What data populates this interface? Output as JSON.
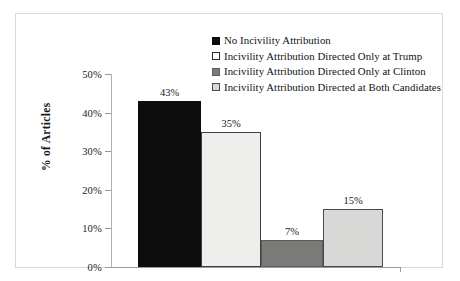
{
  "chart_data": {
    "type": "bar",
    "title": "",
    "xlabel": "",
    "ylabel": "% of Articles",
    "ylim": [
      0,
      50
    ],
    "ytick_labels": [
      "0%",
      "10%",
      "20%",
      "30%",
      "40%",
      "50%"
    ],
    "ytick_values": [
      0,
      10,
      20,
      30,
      40,
      50
    ],
    "grid": false,
    "legend_position": "top-right",
    "categories": [
      "No Incivility Attribution",
      "Incivility Attribution Directed Only at Trump",
      "Incivility Attribution Directed Only at Clinton",
      "Incivility Attribution Directed at Both Candidates"
    ],
    "values": [
      43,
      35,
      7,
      15
    ],
    "data_labels": [
      "43%",
      "35%",
      "7%",
      "15%"
    ],
    "colors": [
      "#0d0c0c",
      "#eeeeec",
      "#7a7a78",
      "#d8d8d6"
    ],
    "bar_border_color": "#4a4a4a"
  },
  "axis": {
    "y_title": "% of Articles",
    "ticks": [
      {
        "label": "50%",
        "value": 50
      },
      {
        "label": "40%",
        "value": 40
      },
      {
        "label": "30%",
        "value": 30
      },
      {
        "label": "20%",
        "value": 20
      },
      {
        "label": "10%",
        "value": 10
      },
      {
        "label": "0%",
        "value": 0
      }
    ]
  },
  "bars": [
    {
      "label": "43%",
      "value": 43,
      "fill": "#0d0c0c",
      "stroke": "#0d0c0c"
    },
    {
      "label": "35%",
      "value": 35,
      "fill": "#eeeeec",
      "stroke": "#3f3f3f"
    },
    {
      "label": "7%",
      "value": 7,
      "fill": "#7a7a78",
      "stroke": "#5d5d5b"
    },
    {
      "label": "15%",
      "value": 15,
      "fill": "#d8d8d6",
      "stroke": "#4a4a4a"
    }
  ],
  "legend": {
    "items": [
      {
        "label": "No Incivility Attribution",
        "fill": "#0d0c0c",
        "stroke": "#0d0c0c"
      },
      {
        "label": "Incivility Attribution Directed Only at Trump",
        "fill": "#ffffff",
        "stroke": "#2b2b2b"
      },
      {
        "label": "Incivility Attribution Directed Only at Clinton",
        "fill": "#7a7a78",
        "stroke": "#5d5d5b"
      },
      {
        "label": "Incivility Attribution Directed at Both Candidates",
        "fill": "#d8d8d6",
        "stroke": "#4a4a4a"
      }
    ]
  }
}
